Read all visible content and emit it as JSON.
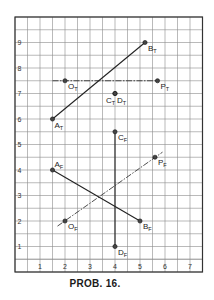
{
  "caption": "PROB. 16.",
  "grid": {
    "x_min": 0,
    "x_max": 7.5,
    "y_min": 0,
    "y_max": 10,
    "minor_step": 0.5,
    "x_ticks": [
      "1",
      "2",
      "3",
      "4",
      "5",
      "6",
      "7"
    ],
    "y_ticks": [
      "1",
      "2",
      "3",
      "4",
      "5",
      "6",
      "7",
      "8",
      "9"
    ],
    "line_color": "#8c8c8c",
    "border_color": "#333333"
  },
  "top_view": {
    "segments": [
      {
        "name": "AT-BT",
        "from": [
          1.5,
          6.0
        ],
        "to": [
          5.2,
          9.0
        ],
        "style": "solid"
      },
      {
        "name": "OT-PT",
        "from": [
          1.5,
          7.5
        ],
        "to": [
          5.7,
          7.5
        ],
        "style": "dashed"
      }
    ],
    "points": [
      {
        "id": "A",
        "sub": "T",
        "x": 1.5,
        "y": 6.0,
        "label_dx": 2,
        "label_dy": 9
      },
      {
        "id": "B",
        "sub": "T",
        "x": 5.2,
        "y": 9.0,
        "label_dx": 3,
        "label_dy": 8
      },
      {
        "id": "O",
        "sub": "T",
        "x": 2.0,
        "y": 7.5,
        "label_dx": 3,
        "label_dy": 8
      },
      {
        "id": "P",
        "sub": "T",
        "x": 5.7,
        "y": 7.5,
        "label_dx": 3,
        "label_dy": 8
      },
      {
        "id": "C",
        "sub": "T",
        "x": 4.0,
        "y": 7.0,
        "label_dx": -9,
        "label_dy": 9
      },
      {
        "id": "D",
        "sub": "T",
        "x": 4.0,
        "y": 7.0,
        "label_dx": 2,
        "label_dy": 9
      }
    ]
  },
  "front_view": {
    "segments": [
      {
        "name": "AF-BF",
        "from": [
          1.5,
          4.0
        ],
        "to": [
          5.0,
          2.0
        ],
        "style": "solid"
      },
      {
        "name": "CF-DF",
        "from": [
          4.0,
          5.5
        ],
        "to": [
          4.0,
          1.0
        ],
        "style": "solid"
      },
      {
        "name": "OF-PF",
        "from": [
          1.7,
          1.8
        ],
        "to": [
          5.9,
          4.7
        ],
        "style": "dashed"
      }
    ],
    "points": [
      {
        "id": "A",
        "sub": "F",
        "x": 1.5,
        "y": 4.0,
        "label_dx": 2,
        "label_dy": -3
      },
      {
        "id": "B",
        "sub": "F",
        "x": 5.0,
        "y": 2.0,
        "label_dx": 3,
        "label_dy": 8
      },
      {
        "id": "C",
        "sub": "F",
        "x": 4.0,
        "y": 5.5,
        "label_dx": 3,
        "label_dy": 8
      },
      {
        "id": "D",
        "sub": "F",
        "x": 4.0,
        "y": 1.0,
        "label_dx": 3,
        "label_dy": 8
      },
      {
        "id": "O",
        "sub": "F",
        "x": 2.0,
        "y": 2.0,
        "label_dx": 3,
        "label_dy": 8
      },
      {
        "id": "P",
        "sub": "F",
        "x": 5.6,
        "y": 4.5,
        "label_dx": 3,
        "label_dy": 8
      }
    ]
  }
}
